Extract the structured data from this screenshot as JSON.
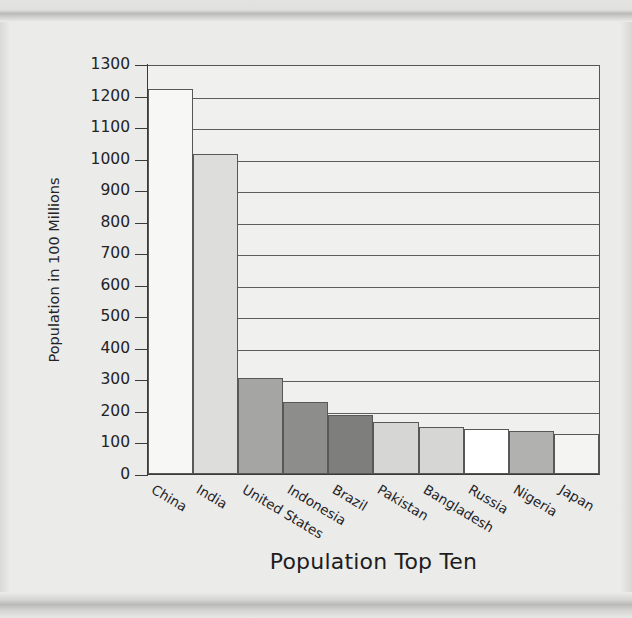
{
  "page": {
    "background_color": "#ebebe9",
    "band_color": "#b9b9b7"
  },
  "chart_data": {
    "type": "bar",
    "title": "Population Top Ten",
    "xlabel": "Population Top Ten",
    "ylabel": "Population in 100 Millions",
    "categories": [
      "China",
      "India",
      "United States",
      "Indonesia",
      "Brazil",
      "Pakistan",
      "Bangladesh",
      "Russia",
      "Nigeria",
      "Japan"
    ],
    "values": [
      1220,
      1015,
      303,
      228,
      187,
      165,
      150,
      142,
      135,
      128
    ],
    "bar_colors": [
      "#f7f7f5",
      "#dddddb",
      "#a5a5a3",
      "#8d8d8b",
      "#7e7e7c",
      "#d6d6d4",
      "#d6d6d4",
      "#ffffff",
      "#b1b1af",
      "#f4f4f2"
    ],
    "bar_border_color": "#585856",
    "ylim": [
      0,
      1300
    ],
    "ytick_values": [
      0,
      100,
      200,
      300,
      400,
      500,
      600,
      700,
      800,
      900,
      1000,
      1100,
      1200,
      1300
    ],
    "ytick_labels": [
      "0",
      "100",
      "200",
      "300",
      "400",
      "500",
      "600",
      "700",
      "800",
      "900",
      "1000",
      "1100",
      "1200",
      "1300"
    ],
    "gridline_values": [
      200,
      300,
      400,
      500,
      600,
      700,
      800,
      900,
      1000,
      1100,
      1200
    ],
    "grid": true,
    "legend": "none",
    "plot_background": "#f0f0ee",
    "axis_color": "#3a3a38"
  }
}
